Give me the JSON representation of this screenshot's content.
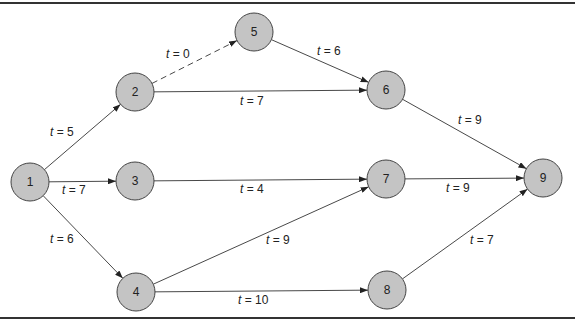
{
  "diagram": {
    "type": "activity-network",
    "node_fill": "#c4c4c4",
    "nodes": [
      {
        "id": "1",
        "label": "1",
        "x": 30,
        "y": 182
      },
      {
        "id": "2",
        "label": "2",
        "x": 135,
        "y": 92
      },
      {
        "id": "3",
        "label": "3",
        "x": 135,
        "y": 181
      },
      {
        "id": "4",
        "label": "4",
        "x": 136,
        "y": 292
      },
      {
        "id": "5",
        "label": "5",
        "x": 254,
        "y": 32
      },
      {
        "id": "6",
        "label": "6",
        "x": 386,
        "y": 90
      },
      {
        "id": "7",
        "label": "7",
        "x": 386,
        "y": 179
      },
      {
        "id": "8",
        "label": "8",
        "x": 387,
        "y": 290
      },
      {
        "id": "9",
        "label": "9",
        "x": 543,
        "y": 178
      }
    ],
    "edges": [
      {
        "from": "1",
        "to": "2",
        "label": "t = 5",
        "dashed": false,
        "lx": 50,
        "ly": 136
      },
      {
        "from": "1",
        "to": "3",
        "label": "t = 7",
        "dashed": false,
        "lx": 62,
        "ly": 194
      },
      {
        "from": "1",
        "to": "4",
        "label": "t = 6",
        "dashed": false,
        "lx": 50,
        "ly": 243
      },
      {
        "from": "2",
        "to": "5",
        "label": "t = 0",
        "dashed": true,
        "lx": 166,
        "ly": 58
      },
      {
        "from": "2",
        "to": "6",
        "label": "t = 7",
        "dashed": false,
        "lx": 240,
        "ly": 105
      },
      {
        "from": "5",
        "to": "6",
        "label": "t = 6",
        "dashed": false,
        "lx": 317,
        "ly": 55
      },
      {
        "from": "3",
        "to": "7",
        "label": "t = 4",
        "dashed": false,
        "lx": 240,
        "ly": 193
      },
      {
        "from": "4",
        "to": "7",
        "label": "t = 9",
        "dashed": false,
        "lx": 266,
        "ly": 244
      },
      {
        "from": "4",
        "to": "8",
        "label": "t = 10",
        "dashed": false,
        "lx": 238,
        "ly": 304
      },
      {
        "from": "6",
        "to": "9",
        "label": "t = 9",
        "dashed": false,
        "lx": 458,
        "ly": 124
      },
      {
        "from": "7",
        "to": "9",
        "label": "t = 9",
        "dashed": false,
        "lx": 446,
        "ly": 192
      },
      {
        "from": "8",
        "to": "9",
        "label": "t = 7",
        "dashed": false,
        "lx": 470,
        "ly": 244
      }
    ]
  }
}
